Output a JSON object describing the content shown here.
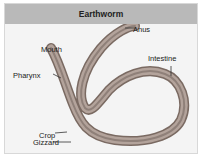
{
  "title": "Earthworm",
  "labels": {
    "anus": "Anus",
    "mouth": "Mouth",
    "intestine": "Intestine",
    "pharynx": "Pharynx",
    "crop": "Crop",
    "gizzard": "Gizzard"
  },
  "colors": {
    "header_bg": "#b9b9b9",
    "panel_bg": "#f4f4f4",
    "worm_outer": "#8a7a72",
    "worm_inner": "#b8a8a0",
    "worm_gut": "#9c8f88"
  }
}
